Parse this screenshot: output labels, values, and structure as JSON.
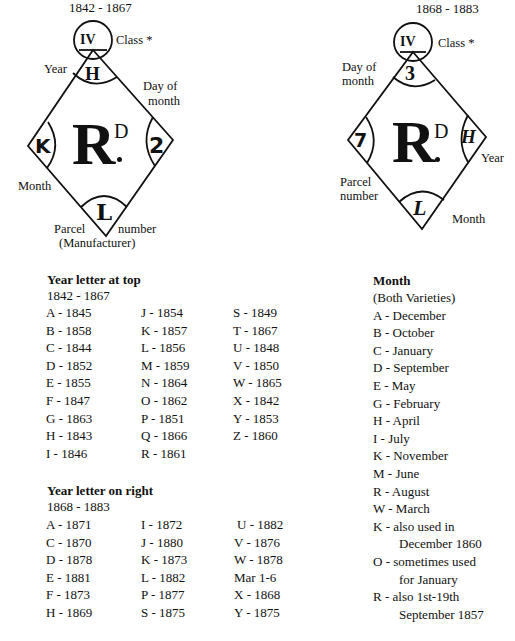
{
  "left_diagram": {
    "period": "1842 - 1867",
    "class_numeral": "IV",
    "class_label": "Class *",
    "top_letter": "H",
    "left_letter": "K",
    "right_letter": "2",
    "bottom_letter": "L",
    "center_mark": "R",
    "center_super": "D",
    "labels": {
      "year": "Year",
      "day_of": "Day of",
      "month_word": "month",
      "month": "Month",
      "parcel": "Parcel",
      "number": "number",
      "manufacturer": "(Manufacturer)"
    }
  },
  "right_diagram": {
    "period": "1868 - 1883",
    "class_numeral": "IV",
    "class_label": "Class *",
    "top_letter": "3",
    "left_letter": "7",
    "right_letter": "H",
    "bottom_letter": "L",
    "center_mark": "R",
    "center_super": "D",
    "labels": {
      "day_of": "Day of",
      "month_word": "month",
      "year": "Year",
      "parcel": "Parcel",
      "number": "number",
      "month": "Month"
    }
  },
  "table_top": {
    "heading": "Year letter at top",
    "period": "1842 - 1867",
    "columns": [
      [
        "A - 1845",
        "B - 1858",
        "C - 1844",
        "D - 1852",
        "E - 1855",
        "F - 1847",
        "G - 1863",
        "H - 1843",
        "I - 1846"
      ],
      [
        "J - 1854",
        "K - 1857",
        "L - 1856",
        "M - 1859",
        "N - 1864",
        "O - 1862",
        "P - 1851",
        "Q - 1866",
        "R - 1861"
      ],
      [
        "S - 1849",
        "T - 1867",
        "U - 1848",
        "V - 1850",
        "W - 1865",
        "X - 1842",
        "Y - 1853",
        "Z - 1860"
      ]
    ]
  },
  "table_right": {
    "heading": "Year letter on right",
    "period": "1868 - 1883",
    "columns": [
      [
        "A - 1871",
        "C - 1870",
        "D - 1878",
        "E - 1881",
        "F - 1873",
        "H - 1869"
      ],
      [
        "I - 1872",
        "J - 1880",
        "K - 1873",
        "L - 1882",
        "P - 1877",
        "S - 1875"
      ],
      [
        "U - 1882",
        "V - 1876",
        "W - 1878",
        "Mar 1-6",
        "X - 1868",
        "Y - 1875"
      ]
    ]
  },
  "month_table": {
    "heading": "Month",
    "subheading": "(Both Varieties)",
    "rows": [
      "A - December",
      "B - October",
      "C - January",
      "D - September",
      "E - May",
      "G - February",
      "H - April",
      "I - July",
      "K - November",
      "M - June",
      "R - August",
      "W - March"
    ],
    "notes": [
      {
        "line1": "K - also used in",
        "line2": "December 1860"
      },
      {
        "line1": "O - sometimes used",
        "line2": "for January"
      },
      {
        "line1": "R - also 1st-19th",
        "line2": "September 1857"
      }
    ]
  }
}
